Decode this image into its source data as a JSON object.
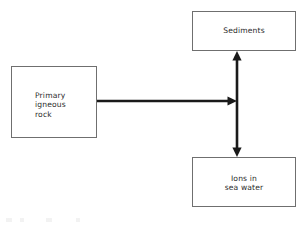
{
  "diagram": {
    "type": "flow-diagram",
    "background_color": "#ffffff",
    "line_color": "#1a1a1a",
    "box_border_color": "#6f6f6f",
    "text_color": "#2b2b2b",
    "nodes": [
      {
        "id": "igneous",
        "label": "Primary\nigneous\nrock",
        "label_line_1": "Primary",
        "label_line_2": "igneous",
        "label_line_3": "rock",
        "align": "left"
      },
      {
        "id": "sediments",
        "label": "Sediments",
        "align": "center"
      },
      {
        "id": "ions",
        "label": "Ions in\nsea water",
        "label_line_1": "Ions in",
        "label_line_2": "sea water",
        "align": "center"
      }
    ],
    "edges": [
      {
        "id": "igneous-to-junction",
        "from": "igneous",
        "to": "junction",
        "heads": "single",
        "direction": "right"
      },
      {
        "id": "sediments-ions",
        "from": "sediments",
        "to": "ions",
        "heads": "double",
        "direction": "vertical"
      }
    ]
  }
}
